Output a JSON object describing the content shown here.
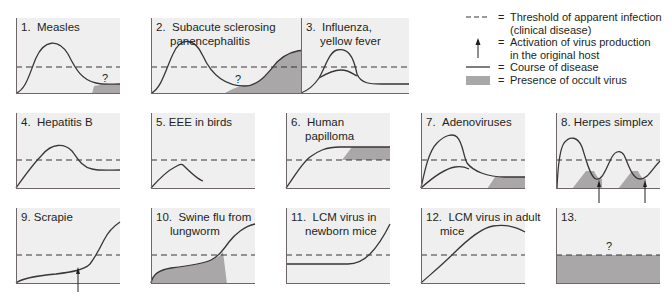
{
  "figure": {
    "colors": {
      "panel_bg": "#efefef",
      "curve": "#3a3536",
      "axis": "#6d6768",
      "threshold": "#3a3536",
      "occult_fill": "#a9a7a8"
    },
    "panels": [
      {
        "id": 1,
        "number": "1.",
        "title_line1": "Measles",
        "title_line2": "",
        "question_mark": "?"
      },
      {
        "id": 2,
        "number": "2.",
        "title_line1": "Subacute sclerosing",
        "title_line2": "panencephalitis",
        "question_mark": "?"
      },
      {
        "id": 3,
        "number": "3.",
        "title_line1": "Influenza,",
        "title_line2": "yellow fever",
        "question_mark": ""
      },
      {
        "id": 4,
        "number": "4.",
        "title_line1": "Hepatitis B",
        "title_line2": "",
        "question_mark": ""
      },
      {
        "id": 5,
        "number": "5.",
        "title_line1": "EEE in birds",
        "title_line2": "",
        "question_mark": ""
      },
      {
        "id": 6,
        "number": "6.",
        "title_line1": "Human",
        "title_line2": "papilloma",
        "question_mark": ""
      },
      {
        "id": 7,
        "number": "7.",
        "title_line1": "Adenoviruses",
        "title_line2": "",
        "question_mark": ""
      },
      {
        "id": 8,
        "number": "8.",
        "title_line1": "Herpes simplex",
        "title_line2": "",
        "question_mark": ""
      },
      {
        "id": 9,
        "number": "9.",
        "title_line1": "Scrapie",
        "title_line2": "",
        "question_mark": ""
      },
      {
        "id": 10,
        "number": "10.",
        "title_line1": "Swine flu from",
        "title_line2": "lungworm",
        "question_mark": ""
      },
      {
        "id": 11,
        "number": "11.",
        "title_line1": "LCM virus in",
        "title_line2": "newborn mice",
        "question_mark": ""
      },
      {
        "id": 12,
        "number": "12.",
        "title_line1": "LCM virus in adult",
        "title_line2": "mice",
        "question_mark": ""
      },
      {
        "id": 13,
        "number": "13.",
        "title_line1": "",
        "title_line2": "",
        "question_mark": "?"
      }
    ],
    "legend": {
      "equals": "=",
      "items": [
        {
          "symbol": "dashed-line",
          "line1": "Threshold of apparent infection",
          "line2": "(clinical disease)"
        },
        {
          "symbol": "up-arrow",
          "line1": "Activation of virus production",
          "line2": "in the original host"
        },
        {
          "symbol": "solid-line",
          "line1": "Course of disease",
          "line2": ""
        },
        {
          "symbol": "gray-box",
          "line1": "Presence of occult virus",
          "line2": ""
        }
      ]
    }
  }
}
